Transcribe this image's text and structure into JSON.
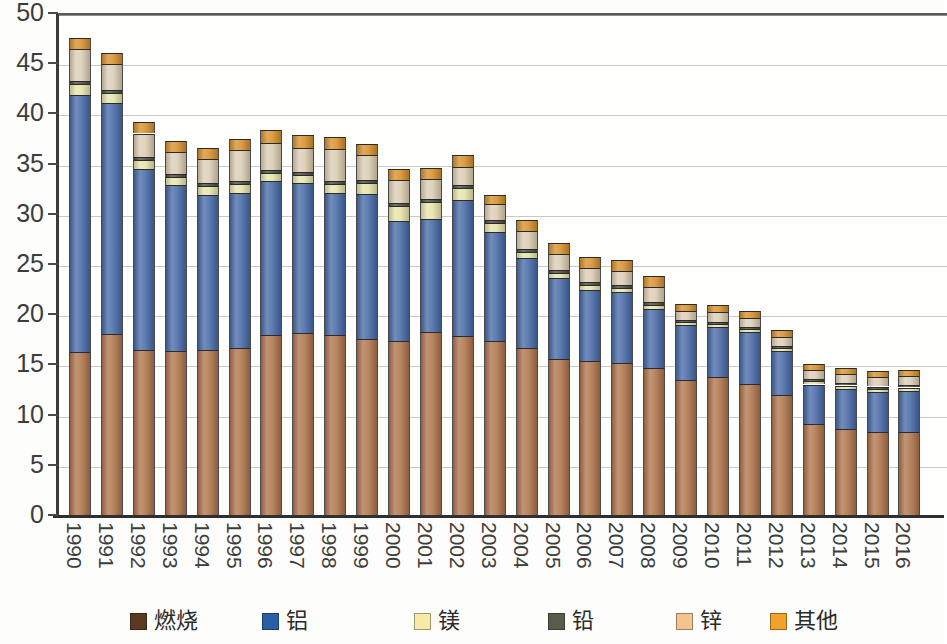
{
  "chart_data": {
    "type": "bar",
    "subtype": "stacked-column",
    "title": "",
    "xlabel": "",
    "ylabel": "",
    "ylim": [
      0,
      50
    ],
    "ytick_step": 5,
    "yticks": [
      0,
      5,
      10,
      15,
      20,
      25,
      30,
      35,
      40,
      45,
      50
    ],
    "ytick_labels": [
      "0",
      "5",
      "10",
      "15",
      "20",
      "25",
      "30",
      "35",
      "40",
      "45",
      "50"
    ],
    "grid": true,
    "grid_axis": "y",
    "legend_position": "bottom",
    "categories": [
      "1990",
      "1991",
      "1992",
      "1993",
      "1994",
      "1995",
      "1996",
      "1997",
      "1998",
      "1999",
      "2000",
      "2001",
      "2002",
      "2003",
      "2004",
      "2005",
      "2006",
      "2007",
      "2008",
      "2009",
      "2010",
      "2011",
      "2012",
      "2013",
      "2014",
      "2015",
      "2016"
    ],
    "series": [
      {
        "name": "燃烧",
        "color": "#b0764e",
        "legend_swatch_color": "#5b3a22",
        "values": [
          16.4,
          18.2,
          16.6,
          16.5,
          16.6,
          16.8,
          18.1,
          18.3,
          18.1,
          17.7,
          17.5,
          18.4,
          18.0,
          17.5,
          16.8,
          15.7,
          15.5,
          15.3,
          14.8,
          13.6,
          13.9,
          13.2,
          12.2,
          9.3,
          8.8,
          8.5,
          8.5
        ]
      },
      {
        "name": "铝",
        "color": "#4a6ca8",
        "legend_swatch_color": "#2a5fa8",
        "values": [
          25.6,
          23.0,
          18.1,
          16.6,
          15.5,
          15.5,
          15.4,
          15.0,
          14.2,
          14.5,
          12.0,
          11.3,
          13.6,
          10.9,
          9.0,
          8.1,
          7.1,
          7.1,
          5.9,
          5.5,
          5.0,
          5.2,
          4.3,
          3.9,
          4.0,
          4.0,
          4.1
        ]
      },
      {
        "name": "镁",
        "color": "#e8e4ac",
        "legend_swatch_color": "#f7e9a8",
        "values": [
          1.1,
          1.0,
          0.9,
          0.8,
          0.9,
          0.9,
          0.8,
          0.8,
          0.9,
          1.1,
          1.5,
          1.7,
          1.2,
          0.9,
          0.6,
          0.5,
          0.5,
          0.4,
          0.4,
          0.3,
          0.3,
          0.3,
          0.3,
          0.3,
          0.3,
          0.3,
          0.3
        ]
      },
      {
        "name": "铅",
        "color": "#4c4d3f",
        "legend_swatch_color": "#5a5c4b",
        "values": [
          0.35,
          0.35,
          0.3,
          0.3,
          0.3,
          0.3,
          0.3,
          0.3,
          0.3,
          0.3,
          0.3,
          0.3,
          0.3,
          0.3,
          0.3,
          0.3,
          0.3,
          0.3,
          0.3,
          0.25,
          0.25,
          0.25,
          0.25,
          0.2,
          0.2,
          0.2,
          0.2
        ]
      },
      {
        "name": "锌",
        "color": "#ddcdb4",
        "legend_swatch_color": "#f4c48e",
        "values": [
          3.2,
          2.6,
          2.3,
          2.2,
          2.4,
          3.1,
          2.7,
          2.4,
          3.2,
          2.5,
          2.3,
          2.0,
          1.8,
          1.6,
          1.8,
          1.6,
          1.4,
          1.4,
          1.5,
          0.9,
          1.0,
          0.9,
          0.9,
          0.9,
          0.9,
          0.9,
          0.9
        ]
      },
      {
        "name": "其他",
        "color": "#d8912f",
        "legend_swatch_color": "#f0a22a",
        "values": [
          1.1,
          1.1,
          1.1,
          1.1,
          1.1,
          1.1,
          1.2,
          1.2,
          1.2,
          1.1,
          1.1,
          1.1,
          1.2,
          0.9,
          1.1,
          1.1,
          1.1,
          1.1,
          1.1,
          0.7,
          0.7,
          0.7,
          0.7,
          0.6,
          0.6,
          0.6,
          0.6
        ]
      }
    ],
    "totals": [
      47.75,
      46.25,
      39.3,
      37.5,
      36.8,
      37.7,
      38.5,
      38.0,
      37.9,
      37.2,
      34.7,
      35.0,
      36.1,
      32.1,
      29.6,
      27.3,
      25.9,
      25.6,
      24.0,
      21.25,
      21.15,
      20.55,
      18.65,
      15.2,
      14.8,
      14.5,
      14.6
    ]
  },
  "legend": {
    "items": [
      {
        "label": "燃烧"
      },
      {
        "label": "铝"
      },
      {
        "label": "镁"
      },
      {
        "label": "铅"
      },
      {
        "label": "锌"
      },
      {
        "label": "其他"
      }
    ]
  }
}
